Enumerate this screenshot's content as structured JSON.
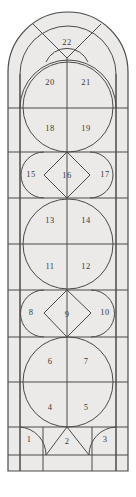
{
  "diagram": {
    "shape": "arched-window",
    "fill_color": "#eceae8",
    "line_color": "#4a4a4a",
    "background_color": "#ffffff",
    "cell_count": 22,
    "cells": [
      {
        "n": 1,
        "label": "1",
        "x": 29,
        "y": 440,
        "shape": "quarter-circle-left"
      },
      {
        "n": 2,
        "label": "2",
        "x": 67,
        "y": 440,
        "shape": "triangle-center"
      },
      {
        "n": 3,
        "label": "3",
        "x": 105,
        "y": 440,
        "shape": "quarter-circle-right"
      },
      {
        "n": 4,
        "label": "4",
        "x": 50,
        "y": 408,
        "shape": "circle-quadrant"
      },
      {
        "n": 5,
        "label": "5",
        "x": 86,
        "y": 408,
        "shape": "circle-quadrant"
      },
      {
        "n": 6,
        "label": "6",
        "x": 50,
        "y": 362,
        "shape": "circle-quadrant"
      },
      {
        "n": 7,
        "label": "7",
        "x": 86,
        "y": 362,
        "shape": "circle-quadrant"
      },
      {
        "n": 8,
        "label": "8",
        "x": 31,
        "y": 313,
        "shape": "half-circle-left"
      },
      {
        "n": 9,
        "label": "9",
        "x": 67,
        "y": 313,
        "shape": "diamond"
      },
      {
        "n": 10,
        "label": "10",
        "x": 104,
        "y": 313,
        "shape": "half-circle-right"
      },
      {
        "n": 11,
        "label": "11",
        "x": 50,
        "y": 267,
        "shape": "circle-quadrant"
      },
      {
        "n": 12,
        "label": "12",
        "x": 86,
        "y": 267,
        "shape": "circle-quadrant"
      },
      {
        "n": 13,
        "label": "13",
        "x": 50,
        "y": 221,
        "shape": "circle-quadrant"
      },
      {
        "n": 14,
        "label": "14",
        "x": 86,
        "y": 221,
        "shape": "circle-quadrant"
      },
      {
        "n": 15,
        "label": "15",
        "x": 31,
        "y": 175,
        "shape": "half-circle-left"
      },
      {
        "n": 16,
        "label": "16",
        "x": 67,
        "y": 175,
        "shape": "diamond"
      },
      {
        "n": 17,
        "label": "17",
        "x": 104,
        "y": 175,
        "shape": "half-circle-right"
      },
      {
        "n": 18,
        "label": "18",
        "x": 50,
        "y": 129,
        "shape": "circle-quadrant"
      },
      {
        "n": 19,
        "label": "19",
        "x": 86,
        "y": 129,
        "shape": "circle-quadrant"
      },
      {
        "n": 20,
        "label": "20",
        "x": 50,
        "y": 83,
        "shape": "circle-quadrant"
      },
      {
        "n": 21,
        "label": "21",
        "x": 86,
        "y": 83,
        "shape": "circle-quadrant"
      },
      {
        "n": 22,
        "label": "22",
        "x": 67,
        "y": 40,
        "shape": "arch-keystone"
      }
    ],
    "rows": [
      {
        "name": "arch-crown",
        "top": 14,
        "bottom": 58
      },
      {
        "name": "row-20-21",
        "top": 58,
        "bottom": 108
      },
      {
        "name": "row-18-19",
        "top": 108,
        "bottom": 152
      },
      {
        "name": "row-15-16-17",
        "top": 152,
        "bottom": 198
      },
      {
        "name": "row-13-14",
        "top": 198,
        "bottom": 244
      },
      {
        "name": "row-11-12",
        "top": 244,
        "bottom": 290
      },
      {
        "name": "row-8-9-10",
        "top": 290,
        "bottom": 337
      },
      {
        "name": "row-6-7",
        "top": 337,
        "bottom": 382
      },
      {
        "name": "row-4-5",
        "top": 382,
        "bottom": 427
      },
      {
        "name": "row-1-2-3",
        "top": 427,
        "bottom": 455
      },
      {
        "name": "sill",
        "top": 455,
        "bottom": 471
      }
    ],
    "columns": [
      {
        "name": "left-border",
        "left": 8,
        "right": 20
      },
      {
        "name": "left-inner",
        "left": 20,
        "right": 67
      },
      {
        "name": "right-inner",
        "left": 67,
        "right": 115
      },
      {
        "name": "right-border",
        "left": 115,
        "right": 128
      }
    ]
  }
}
